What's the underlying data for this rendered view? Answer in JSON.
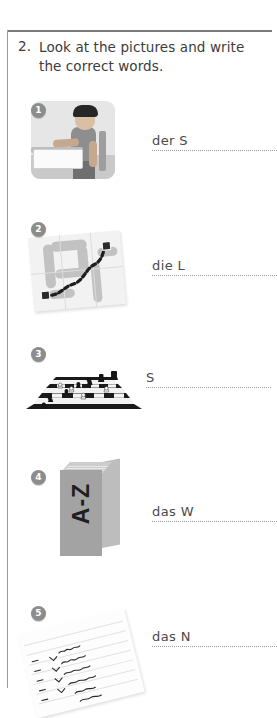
{
  "page": {
    "exercise_number": "2.",
    "instruction": "Look at the pictures and write the correct words."
  },
  "items": [
    {
      "number": "1",
      "answer_prefix": "der S",
      "picture": "person-at-desk-illustration"
    },
    {
      "number": "2",
      "answer_prefix": "die L",
      "picture": "folded-map-with-route-illustration"
    },
    {
      "number": "3",
      "answer_prefix": "S",
      "picture": "chessboard-with-pieces-illustration"
    },
    {
      "number": "4",
      "answer_prefix": "das W",
      "picture": "dictionary-book-illustration",
      "book_label": "A-Z"
    },
    {
      "number": "5",
      "answer_prefix": "das N",
      "picture": "handwritten-notepad-illustration"
    }
  ],
  "colors": {
    "frame_top": "#7b7b7b",
    "frame_left": "#9a9a9a",
    "badge_background": "#8c8c8c",
    "text": "#3c3c3c",
    "answer_text": "#4a4a4a",
    "dotted_line": "#9d9d9d",
    "page_background": "#ffffff"
  }
}
